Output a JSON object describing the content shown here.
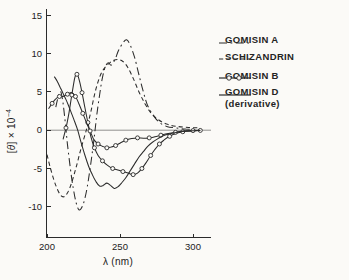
{
  "figure": {
    "background": "#fbfaf7",
    "ink_color": "#2b2b2b"
  },
  "chart_data": {
    "type": "line",
    "title": "",
    "xlabel": "λ (nm)",
    "ylabel": "[θ] × 10⁻⁴",
    "ylabel_parts": {
      "open_bracket": "[",
      "theta": "θ",
      "close_and_times": "] × 10",
      "exponent": "−4"
    },
    "xlim": [
      200,
      307
    ],
    "ylim": [
      -14.5,
      15.8
    ],
    "grid": false,
    "zero_line": true,
    "legend_position": "upper-right-outside",
    "xticks": [
      {
        "value": 200,
        "label": "200"
      },
      {
        "value": 250,
        "label": "250"
      },
      {
        "value": 300,
        "label": "300"
      }
    ],
    "yticks": [
      {
        "value": 15,
        "label": "15"
      },
      {
        "value": 10,
        "label": "10"
      },
      {
        "value": 5,
        "label": "5"
      },
      {
        "value": 0,
        "label": "0"
      },
      {
        "value": -5,
        "label": "-5"
      },
      {
        "value": -10,
        "label": "-10"
      }
    ],
    "series": [
      {
        "name": "GOMISIN A",
        "line_style": "dashdot",
        "marker": "none",
        "points": [
          [
            206,
            3.0
          ],
          [
            208,
            4.6
          ],
          [
            209.5,
            5.0
          ],
          [
            211,
            3.5
          ],
          [
            212.5,
            1.0
          ],
          [
            214,
            -1.8
          ],
          [
            216,
            -5.0
          ],
          [
            218,
            -7.6
          ],
          [
            220,
            -9.5
          ],
          [
            222,
            -10.4
          ],
          [
            224.5,
            -9.8
          ],
          [
            227,
            -8.0
          ],
          [
            229.5,
            -5.0
          ],
          [
            232,
            -1.5
          ],
          [
            234,
            1.8
          ],
          [
            236,
            4.6
          ],
          [
            238,
            6.9
          ],
          [
            240,
            8.3
          ],
          [
            242,
            8.8
          ],
          [
            244,
            8.5
          ],
          [
            246.5,
            9.2
          ],
          [
            249,
            10.4
          ],
          [
            252,
            11.4
          ],
          [
            254.5,
            11.8
          ],
          [
            257,
            11.1
          ],
          [
            260,
            9.5
          ],
          [
            263,
            7.2
          ],
          [
            266,
            5.0
          ],
          [
            269,
            3.2
          ],
          [
            273,
            1.9
          ],
          [
            277,
            1.0
          ],
          [
            282,
            0.5
          ],
          [
            288,
            0.3
          ],
          [
            295,
            0.15
          ],
          [
            305,
            0.05
          ]
        ]
      },
      {
        "name": "SCHIZANDRIN",
        "line_style": "dashed",
        "marker": "none",
        "points": [
          [
            200,
            -3.2
          ],
          [
            203,
            -5.4
          ],
          [
            206,
            -7.2
          ],
          [
            209,
            -8.4
          ],
          [
            211.5,
            -8.7
          ],
          [
            214,
            -8.2
          ],
          [
            217,
            -6.8
          ],
          [
            220,
            -4.8
          ],
          [
            223,
            -2.6
          ],
          [
            226,
            -0.6
          ],
          [
            228,
            0.8
          ],
          [
            230.5,
            2.8
          ],
          [
            233,
            5.0
          ],
          [
            236,
            6.9
          ],
          [
            239,
            8.0
          ],
          [
            243,
            8.8
          ],
          [
            247,
            9.2
          ],
          [
            251,
            9.1
          ],
          [
            255,
            8.3
          ],
          [
            259,
            6.8
          ],
          [
            263,
            5.0
          ],
          [
            267,
            3.5
          ],
          [
            271,
            2.3
          ],
          [
            276,
            1.4
          ],
          [
            282,
            0.8
          ],
          [
            289,
            0.5
          ],
          [
            297,
            0.35
          ],
          [
            305,
            0.3
          ]
        ]
      },
      {
        "name": "GOMISIN B",
        "line_style": "solid",
        "marker": "circle",
        "marker_every": 2,
        "points": [
          [
            211,
            -1.2
          ],
          [
            213,
            0.3
          ],
          [
            215,
            2.2
          ],
          [
            217,
            4.6
          ],
          [
            219,
            6.8
          ],
          [
            220.5,
            7.3
          ],
          [
            222,
            6.6
          ],
          [
            224,
            4.9
          ],
          [
            226,
            2.9
          ],
          [
            228,
            1.0
          ],
          [
            230,
            -0.8
          ],
          [
            232.5,
            -2.3
          ],
          [
            235,
            -3.3
          ],
          [
            238,
            -4.0
          ],
          [
            241.5,
            -4.6
          ],
          [
            245,
            -5.0
          ],
          [
            248.5,
            -5.2
          ],
          [
            252,
            -5.4
          ],
          [
            255.5,
            -5.6
          ],
          [
            259,
            -5.8
          ],
          [
            262,
            -5.6
          ],
          [
            265,
            -5.0
          ],
          [
            268,
            -4.2
          ],
          [
            271,
            -3.3
          ],
          [
            274,
            -2.5
          ],
          [
            277,
            -1.8
          ],
          [
            280,
            -1.3
          ],
          [
            284,
            -0.8
          ],
          [
            288,
            -0.45
          ],
          [
            293,
            -0.2
          ],
          [
            298,
            -0.1
          ],
          [
            305,
            -0.03
          ]
        ]
      },
      {
        "name": "unlabeled second marker trace",
        "line_style": "solid",
        "marker": "circle",
        "marker_every": 2,
        "points": [
          [
            201,
            2.8
          ],
          [
            203.5,
            3.5
          ],
          [
            206,
            4.1
          ],
          [
            208.5,
            4.4
          ],
          [
            211,
            4.4
          ],
          [
            214,
            4.7
          ],
          [
            217,
            4.9
          ],
          [
            219.5,
            4.4
          ],
          [
            222,
            3.4
          ],
          [
            224.5,
            2.2
          ],
          [
            227,
            1.0
          ],
          [
            229.5,
            -0.1
          ],
          [
            232,
            -1.2
          ],
          [
            235,
            -1.8
          ],
          [
            238,
            -2.1
          ],
          [
            241,
            -2.3
          ],
          [
            244,
            -2.2
          ],
          [
            247,
            -2.0
          ],
          [
            250,
            -1.7
          ],
          [
            254,
            -1.3
          ],
          [
            258,
            -1.1
          ],
          [
            262,
            -1.0
          ],
          [
            266,
            -1.05
          ],
          [
            270,
            -1.0
          ],
          [
            274,
            -0.85
          ],
          [
            278,
            -0.65
          ],
          [
            283,
            -0.45
          ],
          [
            288,
            -0.28
          ],
          [
            294,
            -0.12
          ],
          [
            300,
            -0.05
          ],
          [
            305,
            0
          ]
        ]
      },
      {
        "name": "GOMISIN D (derivative)",
        "line_style": "solid",
        "marker": "none",
        "points": [
          [
            205,
            7.0
          ],
          [
            207,
            6.4
          ],
          [
            209,
            5.6
          ],
          [
            211,
            4.8
          ],
          [
            213,
            4.0
          ],
          [
            215,
            3.1
          ],
          [
            217,
            2.1
          ],
          [
            219,
            1.1
          ],
          [
            221,
            0.0
          ],
          [
            223.5,
            -1.7
          ],
          [
            226,
            -3.3
          ],
          [
            228.5,
            -4.7
          ],
          [
            231,
            -5.8
          ],
          [
            233.5,
            -6.7
          ],
          [
            236,
            -7.3
          ],
          [
            238.5,
            -7.2
          ],
          [
            241,
            -6.9
          ],
          [
            243.5,
            -7.2
          ],
          [
            246,
            -7.6
          ],
          [
            248.5,
            -7.4
          ],
          [
            251,
            -6.9
          ],
          [
            254,
            -6.2
          ],
          [
            257,
            -5.3
          ],
          [
            260,
            -4.4
          ],
          [
            263,
            -3.5
          ],
          [
            266,
            -2.8
          ],
          [
            269,
            -2.1
          ],
          [
            272,
            -1.6
          ],
          [
            276,
            -1.1
          ],
          [
            280,
            -0.7
          ],
          [
            285,
            -0.45
          ],
          [
            290,
            -0.25
          ],
          [
            296,
            -0.12
          ],
          [
            305,
            -0.04
          ]
        ]
      }
    ],
    "legend": [
      {
        "label": "GOMISIN A",
        "sublabel": "",
        "line_style": "dashdot",
        "marker": "none"
      },
      {
        "label": "SCHIZANDRIN",
        "sublabel": "",
        "line_style": "dashed",
        "marker": "none"
      },
      {
        "label": "GOMISIN B",
        "sublabel": "",
        "line_style": "solid",
        "marker": "circle"
      },
      {
        "label": "GOMISIN D",
        "sublabel": "(derivative)",
        "line_style": "solid",
        "marker": "none"
      }
    ]
  }
}
